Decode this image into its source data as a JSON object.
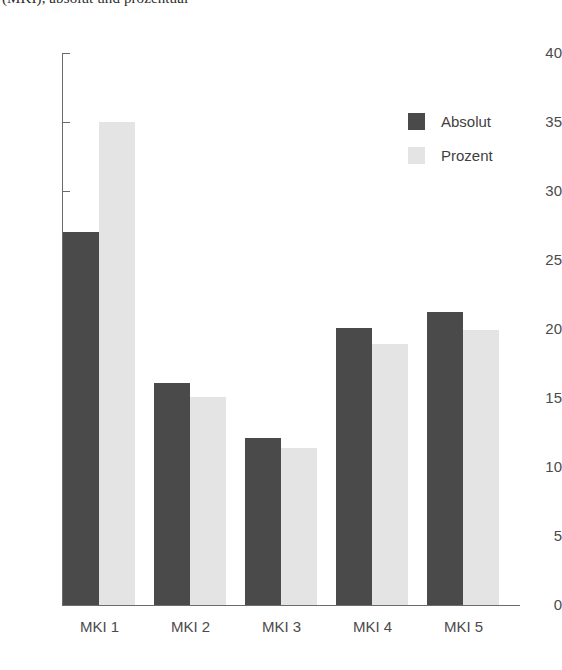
{
  "caption": {
    "text": "(MKI), absolut und prozentual"
  },
  "legend": {
    "position": "top-right",
    "entries": [
      {
        "label": "Absolut",
        "color": "#4a4a4a",
        "swatch": "legend-swatch-absolut"
      },
      {
        "label": "Prozent",
        "color": "#e4e4e4",
        "swatch": "legend-swatch-prozent"
      }
    ]
  },
  "axis": {
    "y_ticks": [
      "0",
      "5",
      "10",
      "15",
      "20",
      "25",
      "30",
      "35",
      "40"
    ],
    "x_ticks": [
      "MKI 1",
      "MKI 2",
      "MKI 3",
      "MKI 4",
      "MKI 5"
    ]
  },
  "chart_data": {
    "type": "bar",
    "title": "(MKI), absolut und prozentual",
    "xlabel": "",
    "ylabel": "",
    "ylim": [
      0,
      40
    ],
    "ytick_step": 5,
    "grid": false,
    "legend_position": "top-right",
    "categories": [
      "MKI 1",
      "MKI 2",
      "MKI 3",
      "MKI 4",
      "MKI 5"
    ],
    "series": [
      {
        "name": "Absolut",
        "color": "#4a4a4a",
        "values": [
          27.0,
          16.1,
          12.1,
          20.1,
          21.2
        ]
      },
      {
        "name": "Prozent",
        "color": "#e4e4e4",
        "values": [
          35.0,
          15.1,
          11.4,
          18.9,
          19.9
        ]
      }
    ]
  }
}
